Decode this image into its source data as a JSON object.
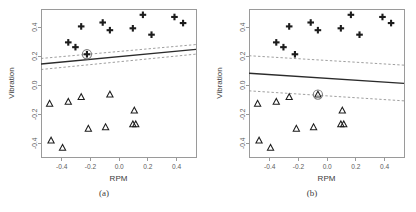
{
  "figure": {
    "background": "#ffffff",
    "panels": [
      {
        "id": "a",
        "caption": "(a)",
        "xlabel": "RPM",
        "ylabel": "Vibration"
      },
      {
        "id": "b",
        "caption": "(b)",
        "xlabel": "RPM",
        "ylabel": "Vibration"
      }
    ]
  },
  "colors": {
    "axis": "#9a9a9a",
    "tick_text": "#5c5c5c",
    "fit_line": "#2b2b2b",
    "ci_line": "#8e8e8e",
    "marker": "#1c1c1c",
    "highlight_ring": "#7d7d7d"
  },
  "chart_data": [
    {
      "type": "scatter",
      "panel": "a",
      "title": "",
      "subtitle": "",
      "caption": "(a)",
      "xlabel": "RPM",
      "ylabel": "Vibration",
      "xlim": [
        -0.545,
        0.535
      ],
      "ylim": [
        -0.495,
        0.525
      ],
      "xticks": [
        -0.4,
        -0.2,
        0.0,
        0.2,
        0.4
      ],
      "xticklabels": [
        "-0.4",
        "-0.2",
        "0.0",
        "0.2",
        "0.4"
      ],
      "yticks": [
        -0.4,
        -0.2,
        0.0,
        0.2,
        0.4
      ],
      "yticklabels": [
        "-0.4",
        "-0.2",
        "0.0",
        "0.2",
        "0.4"
      ],
      "grid": false,
      "legend": false,
      "series": [
        {
          "name": "plus-group",
          "marker": "plus",
          "x": [
            -0.355,
            -0.305,
            -0.265,
            -0.225,
            -0.115,
            -0.065,
            0.095,
            0.165,
            0.225,
            0.385,
            0.445
          ],
          "y": [
            0.295,
            0.262,
            0.405,
            0.213,
            0.432,
            0.379,
            0.392,
            0.485,
            0.348,
            0.47,
            0.428
          ]
        },
        {
          "name": "triangle-group",
          "marker": "triangle",
          "x": [
            -0.485,
            -0.475,
            -0.395,
            -0.355,
            -0.265,
            -0.215,
            -0.095,
            -0.065,
            0.095,
            0.105,
            0.115
          ],
          "y": [
            -0.128,
            -0.382,
            -0.432,
            -0.115,
            -0.082,
            -0.3,
            -0.29,
            -0.065,
            -0.27,
            -0.175,
            -0.27
          ]
        }
      ],
      "highlight_point": {
        "x": -0.225,
        "y": 0.213,
        "radius": 4.6
      },
      "fit_line": {
        "x": [
          -0.545,
          0.535
        ],
        "y": [
          0.146,
          0.247
        ]
      },
      "ci_upper": {
        "x": [
          -0.545,
          0.535
        ],
        "y": [
          0.184,
          0.28
        ]
      },
      "ci_lower": {
        "x": [
          -0.545,
          0.535
        ],
        "y": [
          0.108,
          0.214
        ]
      }
    },
    {
      "type": "scatter",
      "panel": "b",
      "title": "",
      "subtitle": "",
      "caption": "(b)",
      "xlabel": "RPM",
      "ylabel": "Vibration",
      "xlim": [
        -0.545,
        0.535
      ],
      "ylim": [
        -0.495,
        0.525
      ],
      "xticks": [
        -0.4,
        -0.2,
        0.0,
        0.2,
        0.4
      ],
      "xticklabels": [
        "-0.4",
        "-0.2",
        "0.0",
        "0.2",
        "0.4"
      ],
      "yticks": [
        -0.4,
        -0.2,
        0.0,
        0.2,
        0.4
      ],
      "yticklabels": [
        "-0.4",
        "-0.2",
        "0.0",
        "0.2",
        "0.4"
      ],
      "grid": false,
      "legend": false,
      "series": [
        {
          "name": "plus-group",
          "marker": "plus",
          "x": [
            -0.355,
            -0.305,
            -0.265,
            -0.225,
            -0.115,
            -0.065,
            0.095,
            0.165,
            0.225,
            0.385,
            0.445
          ],
          "y": [
            0.295,
            0.262,
            0.405,
            0.213,
            0.432,
            0.379,
            0.392,
            0.485,
            0.348,
            0.47,
            0.428
          ]
        },
        {
          "name": "triangle-group",
          "marker": "triangle",
          "x": [
            -0.485,
            -0.475,
            -0.395,
            -0.355,
            -0.265,
            -0.215,
            -0.095,
            -0.065,
            0.095,
            0.105,
            0.115
          ],
          "y": [
            -0.128,
            -0.382,
            -0.432,
            -0.115,
            -0.082,
            -0.3,
            -0.29,
            -0.065,
            -0.27,
            -0.175,
            -0.27
          ]
        }
      ],
      "highlight_point": {
        "x": -0.065,
        "y": -0.065,
        "radius": 4.6
      },
      "fit_line": {
        "x": [
          -0.545,
          0.535
        ],
        "y": [
          0.082,
          0.012
        ]
      },
      "ci_upper": {
        "x": [
          -0.545,
          0.535
        ],
        "y": [
          0.203,
          0.138
        ]
      },
      "ci_lower": {
        "x": [
          -0.545,
          0.535
        ],
        "y": [
          -0.039,
          -0.108
        ]
      }
    }
  ]
}
